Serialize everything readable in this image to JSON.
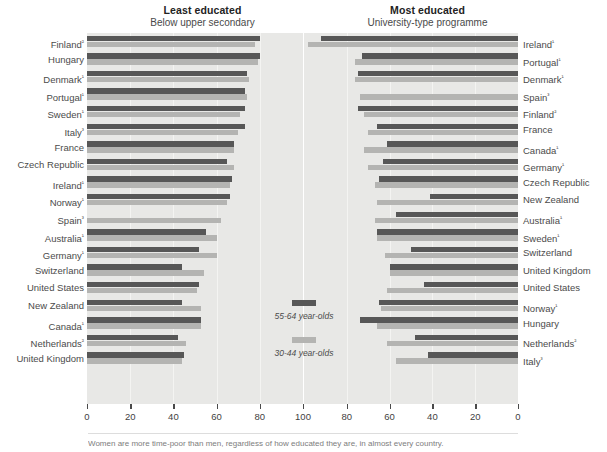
{
  "panels": {
    "left": {
      "title": "Least educated",
      "subtitle": "Below upper secondary"
    },
    "right": {
      "title": "Most educated",
      "subtitle": "University-type programme"
    }
  },
  "legend": {
    "dark_label": "55-64 year-olds",
    "light_label": "30-44 year-olds",
    "dark_color": "#575757",
    "light_color": "#b4b4b2"
  },
  "axis": {
    "left_ticks": [
      "0",
      "20",
      "40",
      "60",
      "80",
      "100"
    ],
    "right_ticks": [
      "80",
      "60",
      "40",
      "20",
      "0"
    ]
  },
  "caption": {
    "text": "Women are more time-poor than men, regardless of how educated they are, in almost every country."
  },
  "chart_data": {
    "type": "bar",
    "orientation": "horizontal",
    "layout": "back-to-back dual panel",
    "xlabel": "",
    "ylabel": "",
    "grid": true,
    "legend_position": "center",
    "series_names": [
      "55-64 year-olds",
      "30-44 year-olds"
    ],
    "panels": [
      {
        "name": "Least educated",
        "subtitle": "Below upper secondary",
        "xlim": [
          0,
          100
        ],
        "direction": "left-to-right",
        "ticks": [
          0,
          20,
          40,
          60,
          80,
          100
        ],
        "categories": [
          "Finland²",
          "Hungary",
          "Denmark¹",
          "Portugal¹",
          "Sweden¹",
          "Italy³",
          "France",
          "Czech Republic",
          "Ireland¹",
          "Norway¹",
          "Spain³",
          "Australia¹",
          "Germany¹",
          "Switzerland",
          "United States",
          "New Zealand",
          "Canada¹",
          "Netherlands²",
          "United Kingdom"
        ],
        "series": [
          {
            "name": "55-64 year-olds",
            "values": [
              80,
              80,
              74,
              73,
              73,
              73,
              68,
              65,
              67,
              66,
              0,
              55,
              52,
              44,
              52,
              44,
              53,
              42,
              45
            ]
          },
          {
            "name": "30-44 year-olds",
            "values": [
              78,
              79,
              75,
              74,
              71,
              70,
              68,
              68,
              66,
              65,
              62,
              60,
              60,
              54,
              51,
              53,
              53,
              46,
              44
            ]
          }
        ]
      },
      {
        "name": "Most educated",
        "subtitle": "University-type programme",
        "xlim": [
          0,
          100
        ],
        "direction": "right-to-left",
        "ticks": [
          100,
          80,
          60,
          40,
          20,
          0
        ],
        "categories": [
          "Ireland¹",
          "Portugal¹",
          "Denmark¹",
          "Spain³",
          "Finland²",
          "France",
          "Canada¹",
          "Germany¹",
          "Czech Republic",
          "New Zealand",
          "Australia¹",
          "Sweden¹",
          "Switzerland",
          "United Kingdom",
          "United States",
          "Norway¹",
          "Hungary",
          "Netherlands²",
          "Italy³"
        ],
        "series": [
          {
            "name": "55-64 year-olds",
            "values": [
              92,
              73,
              75,
              0,
              75,
              66,
              61,
              63,
              65,
              41,
              57,
              66,
              50,
              60,
              44,
              65,
              74,
              48,
              42
            ]
          },
          {
            "name": "30-44 year-olds",
            "values": [
              98,
              76,
              76,
              74,
              72,
              70,
              72,
              70,
              67,
              66,
              67,
              66,
              62,
              60,
              61,
              64,
              66,
              61,
              57
            ]
          }
        ]
      }
    ]
  }
}
